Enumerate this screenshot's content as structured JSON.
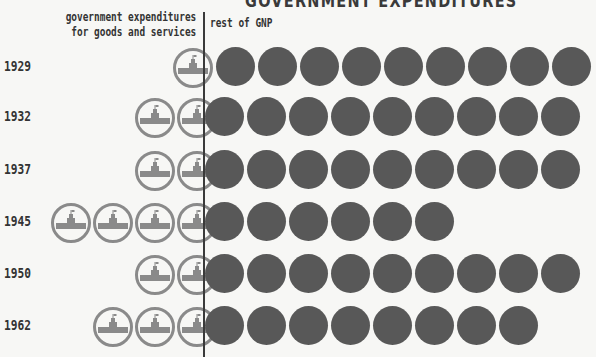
{
  "title": "GOVERNMENT EXPENDITURES",
  "legend": {
    "left_line1": "government expenditures",
    "left_line2": "for goods and services",
    "right": "rest of GNP"
  },
  "colors": {
    "gov_icon": "#8a8a8a",
    "gnp_circle": "#585858",
    "divider": "#3a3a3a"
  },
  "chart_data": {
    "type": "pictogram",
    "unit_note": "each symbol = equal share of GNP",
    "legend": [
      "government expenditures for goods and services",
      "rest of GNP"
    ],
    "categories": [
      "1929",
      "1932",
      "1937",
      "1945",
      "1950",
      "1962"
    ],
    "series": [
      {
        "name": "government expenditures for goods and services",
        "values": [
          1,
          1.5,
          1.5,
          4,
          1.5,
          2.5
        ]
      },
      {
        "name": "rest of GNP",
        "values": [
          9,
          9,
          9,
          6,
          9,
          8
        ]
      }
    ]
  },
  "rows": [
    {
      "year": "1929",
      "gov_full": 0,
      "gov_partial": 1,
      "gnp": 9
    },
    {
      "year": "1932",
      "gov_full": 1,
      "gov_partial": 1,
      "gnp": 9
    },
    {
      "year": "1937",
      "gov_full": 1,
      "gov_partial": 1,
      "gnp": 9
    },
    {
      "year": "1945",
      "gov_full": 3,
      "gov_partial": 1,
      "gnp": 6
    },
    {
      "year": "1950",
      "gov_full": 1,
      "gov_partial": 1,
      "gnp": 9
    },
    {
      "year": "1962",
      "gov_full": 2,
      "gov_partial": 1,
      "gnp": 8
    }
  ]
}
